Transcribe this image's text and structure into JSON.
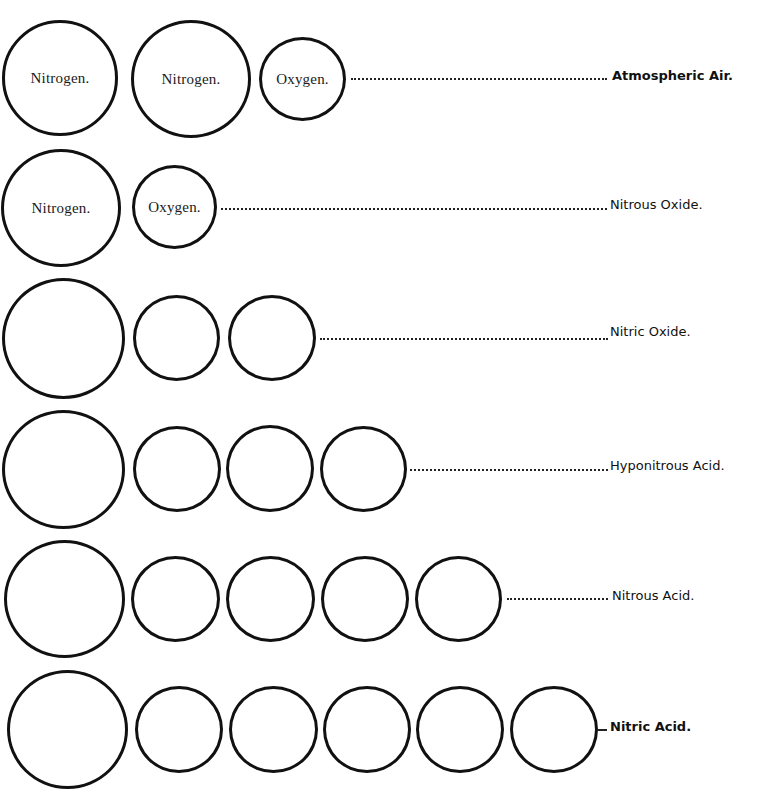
{
  "rows": [
    {
      "label": "Atmospheric Air.",
      "bold": true,
      "circles": [
        {
          "kind": "nitrogen",
          "text": "Nitrogen."
        },
        {
          "kind": "nitrogen",
          "text": "Nitrogen."
        },
        {
          "kind": "oxygen",
          "text": "Oxygen."
        }
      ]
    },
    {
      "label": "Nitrous Oxide.",
      "bold": false,
      "circles": [
        {
          "kind": "nitrogen",
          "text": "Nitrogen."
        },
        {
          "kind": "oxygen",
          "text": "Oxygen."
        }
      ]
    },
    {
      "label": "Nitric Oxide.",
      "bold": false,
      "circles": [
        {
          "kind": "nitrogen",
          "text": ""
        },
        {
          "kind": "oxygen",
          "text": ""
        },
        {
          "kind": "oxygen",
          "text": ""
        }
      ]
    },
    {
      "label": "Hyponitrous Acid.",
      "bold": false,
      "circles": [
        {
          "kind": "nitrogen",
          "text": ""
        },
        {
          "kind": "oxygen",
          "text": ""
        },
        {
          "kind": "oxygen",
          "text": ""
        },
        {
          "kind": "oxygen",
          "text": ""
        }
      ]
    },
    {
      "label": "Nitrous Acid.",
      "bold": false,
      "circles": [
        {
          "kind": "nitrogen",
          "text": ""
        },
        {
          "kind": "oxygen",
          "text": ""
        },
        {
          "kind": "oxygen",
          "text": ""
        },
        {
          "kind": "oxygen",
          "text": ""
        },
        {
          "kind": "oxygen",
          "text": ""
        }
      ]
    },
    {
      "label": "Nitric Acid.",
      "bold": true,
      "circles": [
        {
          "kind": "nitrogen",
          "text": ""
        },
        {
          "kind": "oxygen",
          "text": ""
        },
        {
          "kind": "oxygen",
          "text": ""
        },
        {
          "kind": "oxygen",
          "text": ""
        },
        {
          "kind": "oxygen",
          "text": ""
        },
        {
          "kind": "oxygen",
          "text": ""
        }
      ]
    }
  ],
  "colors": {
    "ink": "#111111",
    "paper": "#ffffff"
  }
}
